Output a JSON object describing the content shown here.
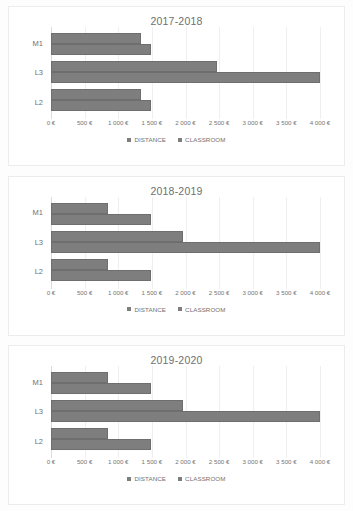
{
  "chart_data": [
    {
      "type": "bar",
      "orientation": "horizontal",
      "title": "2017-2018",
      "categories": [
        "M1",
        "L3",
        "L2"
      ],
      "series": [
        {
          "name": "DISTANCE",
          "values": [
            1340,
            2470,
            1340
          ]
        },
        {
          "name": "CLASSROOM",
          "values": [
            1480,
            4000,
            1480
          ]
        }
      ],
      "xlabel": "",
      "ylabel": "",
      "xlim": [
        0,
        4000
      ],
      "xticks": [
        0,
        500,
        1000,
        1500,
        2000,
        2500,
        3000,
        3500,
        4000
      ],
      "xticklabels": [
        "0 €",
        "500 €",
        "1 000 €",
        "1 500 €",
        "2 000 €",
        "2 500 €",
        "3 000 €",
        "3 500 €",
        "4 000 €"
      ],
      "grid": true,
      "legend_position": "bottom"
    },
    {
      "type": "bar",
      "orientation": "horizontal",
      "title": "2018-2019",
      "categories": [
        "M1",
        "L3",
        "L2"
      ],
      "series": [
        {
          "name": "DISTANCE",
          "values": [
            850,
            1970,
            850
          ]
        },
        {
          "name": "CLASSROOM",
          "values": [
            1480,
            4000,
            1480
          ]
        }
      ],
      "xlabel": "",
      "ylabel": "",
      "xlim": [
        0,
        4000
      ],
      "xticks": [
        0,
        500,
        1000,
        1500,
        2000,
        2500,
        3000,
        3500,
        4000
      ],
      "xticklabels": [
        "0 €",
        "500 €",
        "1 000 €",
        "1 500 €",
        "2 000 €",
        "2 500 €",
        "3 000 €",
        "3 500 €",
        "4 000 €"
      ],
      "grid": true,
      "legend_position": "bottom"
    },
    {
      "type": "bar",
      "orientation": "horizontal",
      "title": "2019-2020",
      "categories": [
        "M1",
        "L3",
        "L2"
      ],
      "series": [
        {
          "name": "DISTANCE",
          "values": [
            850,
            1970,
            850
          ]
        },
        {
          "name": "CLASSROOM",
          "values": [
            1480,
            4000,
            1480
          ]
        }
      ],
      "xlabel": "",
      "ylabel": "",
      "xlim": [
        0,
        4000
      ],
      "xticks": [
        0,
        500,
        1000,
        1500,
        2000,
        2500,
        3000,
        3500,
        4000
      ],
      "xticklabels": [
        "0 €",
        "500 €",
        "1 000 €",
        "1 500 €",
        "2 000 €",
        "2 500 €",
        "3 000 €",
        "3 500 €",
        "4 000 €"
      ],
      "grid": true,
      "legend_position": "bottom"
    }
  ],
  "colors": {
    "bar": "#7e7e7e",
    "grid": "#efeff0",
    "axis": "#dcdcdd",
    "text": "#707070",
    "panel_border": "#ececed",
    "background": "#ffffff"
  }
}
